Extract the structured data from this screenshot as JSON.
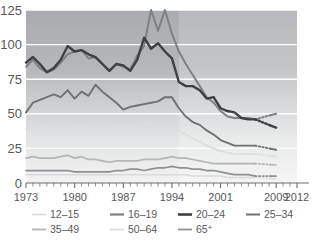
{
  "chart_data": {
    "type": "line",
    "title": "",
    "subtitle": "",
    "xlabel": "",
    "ylabel": "",
    "xlim": [
      1973,
      2012
    ],
    "ylim": [
      0,
      125
    ],
    "yticks": [
      0,
      25,
      50,
      75,
      100,
      125
    ],
    "ytick_labels": [
      "0",
      "25",
      "50",
      "75",
      "100",
      "125"
    ],
    "xtick_labels": [
      "1973",
      "1980",
      "1987",
      "1994",
      "2001",
      "2009",
      "2012"
    ],
    "xtick_values": [
      1973,
      1980,
      1987,
      1994,
      2001,
      2009,
      2012
    ],
    "minor_ticks_every": 1,
    "grid": "horizontal-white",
    "legend_position": "bottom",
    "break_note": "dotted segments span 2006-2008 (data gap)",
    "series": [
      {
        "name": "12–15",
        "color": "#d9dadb",
        "x": [
          1973,
          1974,
          1975,
          1976,
          1977,
          1978,
          1979,
          1980,
          1981,
          1982,
          1983,
          1984,
          1985,
          1986,
          1987,
          1988,
          1989,
          1990,
          1991,
          1992,
          1993,
          1994,
          1995,
          1996,
          1997,
          1998,
          1999,
          2000,
          2001,
          2002,
          2003,
          2004,
          2005,
          2006,
          2009
        ],
        "values": [
          6,
          6,
          6,
          6,
          6,
          6,
          6,
          6,
          6,
          6,
          6,
          6,
          6,
          6,
          6,
          6,
          6,
          6,
          6,
          6,
          6,
          6,
          6,
          6,
          5,
          5,
          5,
          5,
          5,
          4,
          4,
          4,
          4,
          4,
          3
        ]
      },
      {
        "name": "16–19",
        "color": "#7f8083",
        "x": [
          1973,
          1974,
          1975,
          1976,
          1977,
          1978,
          1979,
          1980,
          1981,
          1982,
          1983,
          1984,
          1985,
          1986,
          1987,
          1988,
          1989,
          1990,
          1991,
          1992,
          1993,
          1994,
          1995,
          1996,
          1997,
          1998,
          1999,
          2000,
          2001,
          2002,
          2003,
          2004,
          2005,
          2006,
          2009
        ],
        "values": [
          84,
          89,
          83,
          80,
          82,
          87,
          93,
          95,
          96,
          90,
          91,
          86,
          81,
          86,
          84,
          82,
          92,
          99,
          125,
          110,
          125,
          108,
          95,
          86,
          78,
          70,
          62,
          58,
          52,
          48,
          47,
          47,
          47,
          46,
          50
        ]
      },
      {
        "name": "20–24",
        "color": "#3f4043",
        "x": [
          1973,
          1974,
          1975,
          1976,
          1977,
          1978,
          1979,
          1980,
          1981,
          1982,
          1983,
          1984,
          1985,
          1986,
          1987,
          1988,
          1989,
          1990,
          1991,
          1992,
          1993,
          1994,
          1995,
          1996,
          1997,
          1998,
          1999,
          2000,
          2001,
          2002,
          2003,
          2004,
          2005,
          2006,
          2009
        ],
        "values": [
          87,
          91,
          86,
          80,
          83,
          89,
          99,
          95,
          96,
          93,
          91,
          86,
          81,
          86,
          85,
          81,
          89,
          105,
          97,
          101,
          95,
          90,
          73,
          70,
          70,
          67,
          61,
          62,
          54,
          52,
          51,
          47,
          46,
          46,
          40
        ]
      },
      {
        "name": "25–34",
        "color": "#6f7174",
        "x": [
          1973,
          1974,
          1975,
          1976,
          1977,
          1978,
          1979,
          1980,
          1981,
          1982,
          1983,
          1984,
          1985,
          1986,
          1987,
          1988,
          1989,
          1990,
          1991,
          1992,
          1993,
          1994,
          1995,
          1996,
          1997,
          1998,
          1999,
          2000,
          2001,
          2002,
          2003,
          2004,
          2005,
          2006,
          2009
        ],
        "values": [
          51,
          58,
          60,
          62,
          64,
          62,
          67,
          61,
          66,
          63,
          71,
          66,
          62,
          58,
          53,
          55,
          56,
          57,
          58,
          59,
          62,
          62,
          54,
          48,
          44,
          42,
          38,
          35,
          31,
          29,
          27,
          27,
          27,
          27,
          24
        ]
      },
      {
        "name": "35–49",
        "color": "#b3b5b7",
        "x": [
          1973,
          1974,
          1975,
          1976,
          1977,
          1978,
          1979,
          1980,
          1981,
          1982,
          1983,
          1984,
          1985,
          1986,
          1987,
          1988,
          1989,
          1990,
          1991,
          1992,
          1993,
          1994,
          1995,
          1996,
          1997,
          1998,
          1999,
          2000,
          2001,
          2002,
          2003,
          2004,
          2005,
          2006,
          2009
        ],
        "values": [
          18,
          19,
          18,
          18,
          18,
          19,
          20,
          18,
          19,
          17,
          17,
          16,
          15,
          16,
          16,
          16,
          16,
          17,
          17,
          17,
          18,
          19,
          18,
          18,
          17,
          16,
          15,
          14,
          14,
          14,
          14,
          14,
          14,
          14,
          13
        ]
      },
      {
        "name": "50–64",
        "color": "#dcdddf",
        "x": [
          1973,
          1974,
          1975,
          1976,
          1977,
          1978,
          1979,
          1980,
          1981,
          1982,
          1983,
          1984,
          1985,
          1986,
          1987,
          1988,
          1989,
          1990,
          1991,
          1992,
          1993,
          1994,
          1995,
          1996,
          1997,
          1998,
          1999,
          2000,
          2001,
          2002,
          2003,
          2004,
          2005,
          2006,
          2009
        ],
        "values": [
          39,
          40,
          41,
          42,
          43,
          42,
          43,
          41,
          42,
          41,
          43,
          41,
          40,
          41,
          41,
          42,
          42,
          43,
          43,
          42,
          43,
          43,
          38,
          35,
          32,
          30,
          27,
          25,
          23,
          22,
          21,
          21,
          21,
          21,
          19
        ]
      },
      {
        "name": "65⁺",
        "color": "#8e9093",
        "x": [
          1973,
          1974,
          1975,
          1976,
          1977,
          1978,
          1979,
          1980,
          1981,
          1982,
          1983,
          1984,
          1985,
          1986,
          1987,
          1988,
          1989,
          1990,
          1991,
          1992,
          1993,
          1994,
          1995,
          1996,
          1997,
          1998,
          1999,
          2000,
          2001,
          2002,
          2003,
          2004,
          2005,
          2006,
          2009
        ],
        "values": [
          9,
          9,
          9,
          9,
          9,
          9,
          9,
          8,
          8,
          8,
          8,
          8,
          8,
          9,
          9,
          10,
          10,
          9,
          10,
          11,
          11,
          12,
          11,
          11,
          10,
          10,
          9,
          9,
          8,
          7,
          6,
          6,
          6,
          5,
          5
        ]
      }
    ]
  },
  "legend": {
    "rows": [
      [
        {
          "label": "12–15",
          "color": "#d9dadb",
          "weight": 1.6
        },
        {
          "label": "16–19",
          "color": "#7f8083",
          "weight": 2.2
        },
        {
          "label": "20–24",
          "color": "#3f4043",
          "weight": 2.6
        },
        {
          "label": "25–34",
          "color": "#6f7174",
          "weight": 2.0
        }
      ],
      [
        {
          "label": "35–49",
          "color": "#b3b5b7",
          "weight": 1.8
        },
        {
          "label": "50–64",
          "color": "#dcdddf",
          "weight": 1.8
        },
        {
          "label": "65",
          "sup": "+",
          "color": "#8e9093",
          "weight": 1.8
        }
      ]
    ]
  },
  "colors": {
    "plot_bg_top": "#a9abae",
    "plot_bg_bottom": "#f2f2f2",
    "gridline": "#ffffff",
    "text": "#58595b",
    "axis": "#6d6e71"
  }
}
